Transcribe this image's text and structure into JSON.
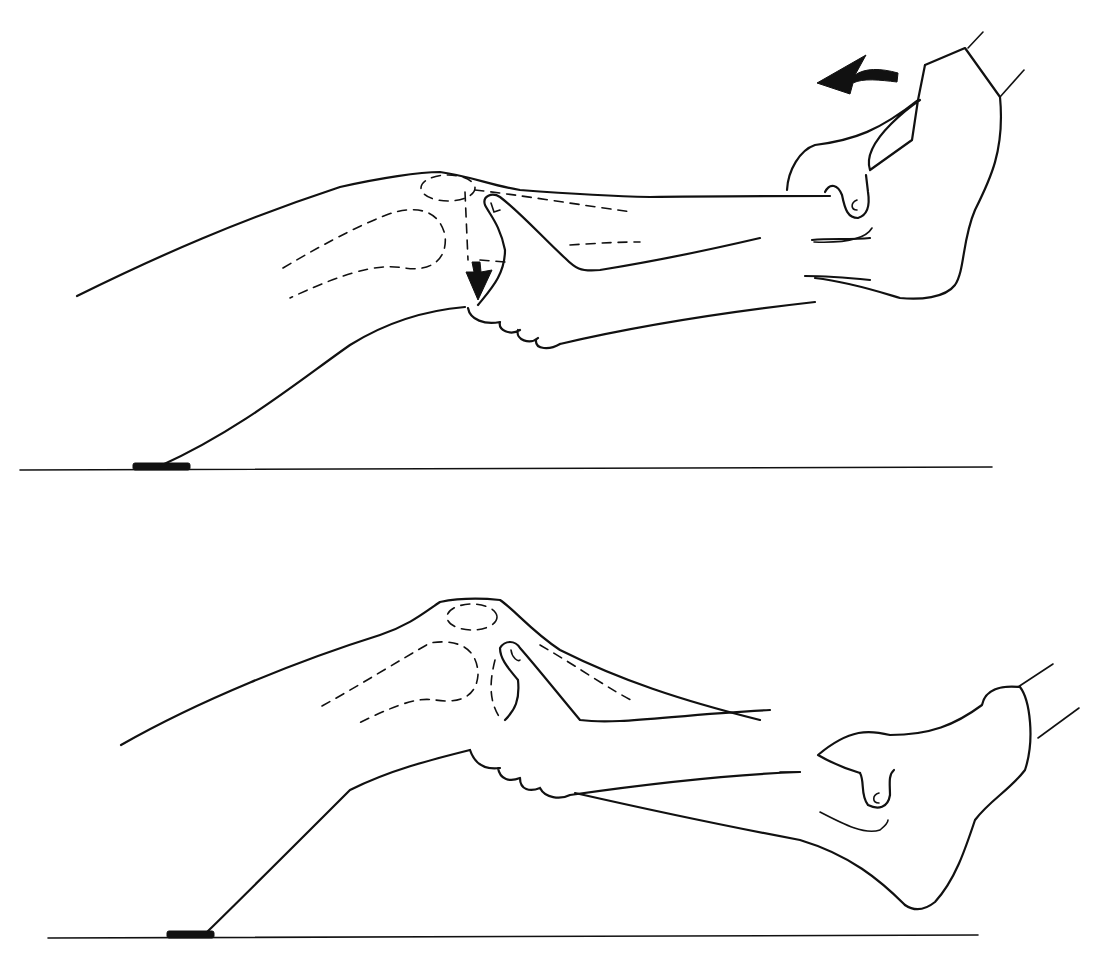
{
  "figure": {
    "type": "anatomical line illustration",
    "panels": [
      {
        "id": "top",
        "description": "Leg extended on table; examiner hand grips below the knee with thumb on joint line; other hand holds foot",
        "arrows": [
          {
            "name": "rotation-arrow",
            "direction": "counter-clockwise / left",
            "location": "above foot"
          },
          {
            "name": "downward-arrow",
            "direction": "down",
            "location": "below knee, medial joint line"
          }
        ]
      },
      {
        "id": "bottom",
        "description": "Knee slightly flexed; examiner thumb palpates joint line below patella; other hand cups heel",
        "arrows": []
      }
    ],
    "colors": {
      "ink": "#111111",
      "background": "#ffffff"
    }
  }
}
